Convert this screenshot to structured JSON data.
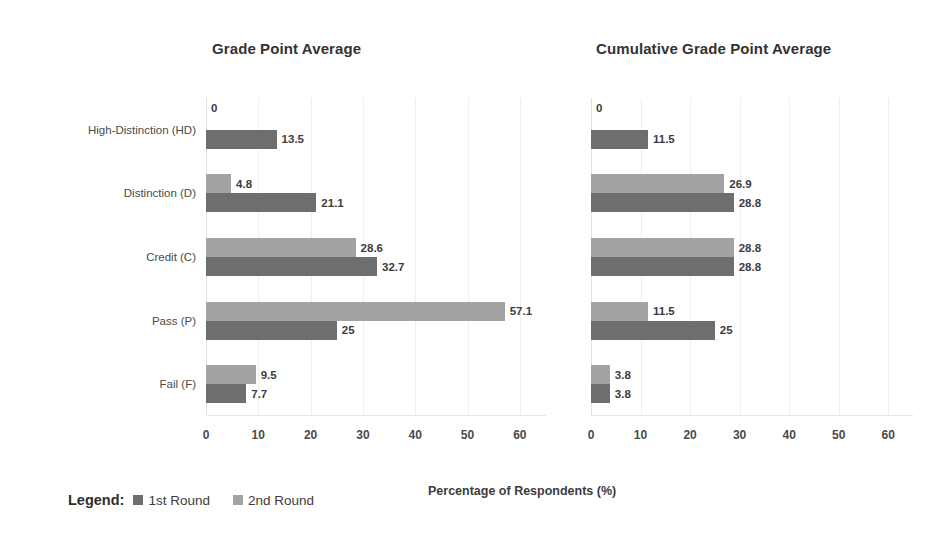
{
  "chart_data": [
    {
      "type": "bar",
      "orientation": "horizontal",
      "title": "Grade Point Average",
      "xlabel": "Percentage of Respondents (%)",
      "ylabel": "",
      "categories": [
        "High-Distinction (HD)",
        "Distinction (D)",
        "Credit (C)",
        "Pass (P)",
        "Fail (F)"
      ],
      "series": [
        {
          "name": "1st Round",
          "color": "#6e6e6e",
          "values": [
            13.5,
            21.1,
            32.7,
            25,
            7.7
          ]
        },
        {
          "name": "2nd Round",
          "color": "#a3a3a3",
          "values": [
            0,
            4.8,
            28.6,
            57.1,
            9.5
          ]
        }
      ],
      "xlim": [
        0,
        65
      ],
      "xticks": [
        0,
        10,
        20,
        30,
        40,
        50,
        60
      ],
      "xtick_labels": [
        "0",
        "10",
        "20",
        "30",
        "40",
        "50",
        "60"
      ],
      "grid": true,
      "legend_position": "bottom-left"
    },
    {
      "type": "bar",
      "orientation": "horizontal",
      "title": "Cumulative Grade Point Average",
      "xlabel": "Percentage of Respondents (%)",
      "ylabel": "",
      "categories": [
        "High-Distinction (HD)",
        "Distinction (D)",
        "Credit (C)",
        "Pass (P)",
        "Fail (F)"
      ],
      "series": [
        {
          "name": "1st Round",
          "color": "#6e6e6e",
          "values": [
            11.5,
            28.8,
            28.8,
            25,
            3.8
          ]
        },
        {
          "name": "2nd Round",
          "color": "#a3a3a3",
          "values": [
            0,
            26.9,
            28.8,
            11.5,
            3.8
          ]
        }
      ],
      "xlim": [
        0,
        65
      ],
      "xticks": [
        0,
        10,
        20,
        30,
        40,
        50,
        60
      ],
      "xtick_labels": [
        "0",
        "10",
        "20",
        "30",
        "40",
        "50",
        "60"
      ],
      "grid": true,
      "legend_position": "bottom-left"
    }
  ],
  "charts": {
    "left": {
      "title": "Grade Point Average",
      "xticks": [
        "0",
        "10",
        "20",
        "30",
        "40",
        "50",
        "60"
      ],
      "rows": [
        {
          "category": "High-Distinction (HD)",
          "round2": {
            "value": 0,
            "label": "0"
          },
          "round1": {
            "value": 13.5,
            "label": "13.5"
          }
        },
        {
          "category": "Distinction (D)",
          "round2": {
            "value": 4.8,
            "label": "4.8"
          },
          "round1": {
            "value": 21.1,
            "label": "21.1"
          }
        },
        {
          "category": "Credit (C)",
          "round2": {
            "value": 28.6,
            "label": "28.6"
          },
          "round1": {
            "value": 32.7,
            "label": "32.7"
          }
        },
        {
          "category": "Pass (P)",
          "round2": {
            "value": 57.1,
            "label": "57.1"
          },
          "round1": {
            "value": 25,
            "label": "25"
          }
        },
        {
          "category": "Fail (F)",
          "round2": {
            "value": 9.5,
            "label": "9.5"
          },
          "round1": {
            "value": 7.7,
            "label": "7.7"
          }
        }
      ]
    },
    "right": {
      "title": "Cumulative Grade Point Average",
      "xticks": [
        "0",
        "10",
        "20",
        "30",
        "40",
        "50",
        "60"
      ],
      "rows": [
        {
          "category": "High-Distinction (HD)",
          "round2": {
            "value": 0,
            "label": "0"
          },
          "round1": {
            "value": 11.5,
            "label": "11.5"
          }
        },
        {
          "category": "Distinction (D)",
          "round2": {
            "value": 26.9,
            "label": "26.9"
          },
          "round1": {
            "value": 28.8,
            "label": "28.8"
          }
        },
        {
          "category": "Credit (C)",
          "round2": {
            "value": 28.8,
            "label": "28.8"
          },
          "round1": {
            "value": 28.8,
            "label": "28.8"
          }
        },
        {
          "category": "Pass (P)",
          "round2": {
            "value": 11.5,
            "label": "11.5"
          },
          "round1": {
            "value": 25,
            "label": "25"
          }
        },
        {
          "category": "Fail (F)",
          "round2": {
            "value": 3.8,
            "label": "3.8"
          },
          "round1": {
            "value": 3.8,
            "label": "3.8"
          }
        }
      ]
    }
  },
  "legend": {
    "title": "Legend:",
    "items": [
      {
        "label": "1st Round",
        "color": "#6e6e6e"
      },
      {
        "label": "2nd Round",
        "color": "#a3a3a3"
      }
    ]
  },
  "axis_title": "Percentage of Respondents (%)",
  "colors": {
    "round1": "#6e6e6e",
    "round2": "#a3a3a3",
    "gridline": "#efefef",
    "text": "#3c3c3c"
  }
}
